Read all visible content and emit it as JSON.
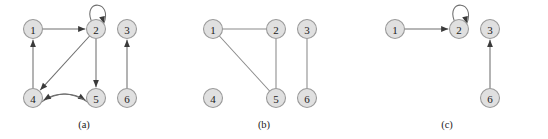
{
  "figure": {
    "width": 548,
    "height": 139,
    "background_color": "#ffffff",
    "node_fill_color": "#e0e0e0",
    "node_stroke_color": "#9a9a9a",
    "edge_color": "#6e6e6e",
    "arrow_color": "#3a3a3a",
    "label_color": "#1a1a1a"
  },
  "panels": [
    {
      "id": "a",
      "caption": "(a)",
      "caption_x": 84,
      "caption_y": 124,
      "graph_type": "directed",
      "nodes": [
        {
          "label": "1",
          "x": 33,
          "y": 29,
          "r": 9.5
        },
        {
          "label": "2",
          "x": 96,
          "y": 29,
          "r": 9.5
        },
        {
          "label": "3",
          "x": 127,
          "y": 29,
          "r": 9.5
        },
        {
          "label": "4",
          "x": 33,
          "y": 98,
          "r": 9.5
        },
        {
          "label": "5",
          "x": 96,
          "y": 98,
          "r": 9.5
        },
        {
          "label": "6",
          "x": 127,
          "y": 98,
          "r": 9.5
        }
      ],
      "edges": [
        {
          "from": "1",
          "to": "2",
          "kind": "straight",
          "directed": true
        },
        {
          "from": "2",
          "to": "2",
          "kind": "self-loop",
          "directed": true
        },
        {
          "from": "2",
          "to": "4",
          "kind": "straight",
          "directed": true
        },
        {
          "from": "2",
          "to": "5",
          "kind": "straight",
          "directed": true
        },
        {
          "from": "4",
          "to": "1",
          "kind": "straight",
          "directed": true
        },
        {
          "from": "4",
          "to": "5",
          "kind": "curve-up",
          "directed": true
        },
        {
          "from": "5",
          "to": "4",
          "kind": "curve-down",
          "directed": true
        },
        {
          "from": "6",
          "to": "3",
          "kind": "straight",
          "directed": true
        }
      ]
    },
    {
      "id": "b",
      "caption": "(b)",
      "caption_x": 264,
      "caption_y": 124,
      "graph_type": "undirected",
      "nodes": [
        {
          "label": "1",
          "x": 213,
          "y": 29,
          "r": 9.5
        },
        {
          "label": "2",
          "x": 276,
          "y": 29,
          "r": 9.5
        },
        {
          "label": "3",
          "x": 307,
          "y": 29,
          "r": 9.5
        },
        {
          "label": "4",
          "x": 213,
          "y": 98,
          "r": 9.5
        },
        {
          "label": "5",
          "x": 276,
          "y": 98,
          "r": 9.5
        },
        {
          "label": "6",
          "x": 307,
          "y": 98,
          "r": 9.5
        }
      ],
      "edges": [
        {
          "from": "1",
          "to": "2",
          "kind": "straight",
          "directed": false
        },
        {
          "from": "1",
          "to": "5",
          "kind": "straight",
          "directed": false
        },
        {
          "from": "2",
          "to": "5",
          "kind": "straight",
          "directed": false
        },
        {
          "from": "3",
          "to": "6",
          "kind": "straight",
          "directed": false
        }
      ]
    },
    {
      "id": "c",
      "caption": "(c)",
      "caption_x": 447,
      "caption_y": 124,
      "graph_type": "directed",
      "nodes": [
        {
          "label": "1",
          "x": 395,
          "y": 29,
          "r": 9.5
        },
        {
          "label": "2",
          "x": 459,
          "y": 29,
          "r": 9.5
        },
        {
          "label": "3",
          "x": 490,
          "y": 29,
          "r": 9.5
        },
        {
          "label": "6",
          "x": 490,
          "y": 98,
          "r": 9.5
        }
      ],
      "edges": [
        {
          "from": "1",
          "to": "2",
          "kind": "straight",
          "directed": true
        },
        {
          "from": "2",
          "to": "2",
          "kind": "self-loop",
          "directed": true
        },
        {
          "from": "6",
          "to": "3",
          "kind": "straight",
          "directed": true
        }
      ]
    }
  ]
}
